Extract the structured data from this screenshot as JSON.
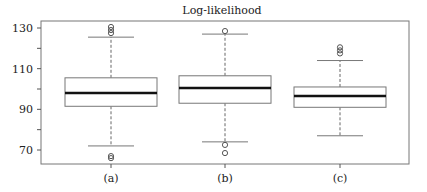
{
  "chart_data": {
    "type": "box",
    "title": "Log-likelihood",
    "xlabel": "",
    "ylabel": "",
    "categories": [
      "(a)",
      "(b)",
      "(c)"
    ],
    "ylim": [
      64,
      133
    ],
    "yticks": [
      70,
      90,
      110,
      130
    ],
    "ytick_labels": [
      "70",
      "90",
      "110",
      "130"
    ],
    "minor_yticks": [
      80,
      100,
      120
    ],
    "grid": false,
    "legend": null,
    "series": [
      {
        "name": "(a)",
        "whisker_low": 72,
        "q1": 91.5,
        "median": 98,
        "q3": 105.5,
        "whisker_high": 125.5,
        "outliers": [
          66,
          67,
          127.5,
          129,
          130.5
        ]
      },
      {
        "name": "(b)",
        "whisker_low": 74,
        "q1": 93,
        "median": 100.5,
        "q3": 106.5,
        "whisker_high": 127,
        "outliers": [
          68.5,
          72.5,
          128.5
        ]
      },
      {
        "name": "(c)",
        "whisker_low": 77,
        "q1": 91,
        "median": 96.5,
        "q3": 101,
        "whisker_high": 114,
        "outliers": [
          117.5,
          119,
          120.5
        ]
      }
    ]
  },
  "colors": {
    "axis": "#555555",
    "box_border": "#777777",
    "median": "#111111",
    "text": "#222222"
  }
}
